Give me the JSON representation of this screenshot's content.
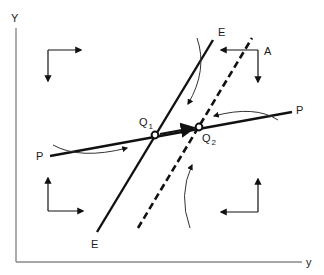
{
  "diagram": {
    "axes": {
      "y_label": "Y",
      "x_label": "y",
      "color": "#8a8a8a"
    },
    "lines": {
      "E": {
        "label_top": "E",
        "label_bottom": "E",
        "style": "solid",
        "from": [
          97,
          232
        ],
        "to": [
          213,
          40
        ]
      },
      "E_shifted": {
        "style": "dashed",
        "from": [
          138,
          228
        ],
        "to": [
          252,
          38
        ]
      },
      "P": {
        "label_left": "P",
        "label_right": "P",
        "style": "solid",
        "from": [
          50,
          156
        ],
        "to": [
          292,
          112
        ]
      }
    },
    "points": {
      "Q1": {
        "label": "Q",
        "subscript": "1",
        "x": 155,
        "y": 135
      },
      "Q2": {
        "label": "Q",
        "subscript": "2",
        "x": 199,
        "y": 127
      }
    },
    "quadrant_arrows": {
      "top_left": {
        "directions": [
          "right",
          "down"
        ]
      },
      "top_right": {
        "label": "A",
        "directions": [
          "left",
          "down"
        ]
      },
      "bottom_left": {
        "directions": [
          "up",
          "right"
        ]
      },
      "bottom_right": {
        "directions": [
          "up",
          "left"
        ]
      }
    },
    "colors": {
      "ink": "#111111",
      "axis": "#8a8a8a",
      "curve": "#333333"
    }
  }
}
